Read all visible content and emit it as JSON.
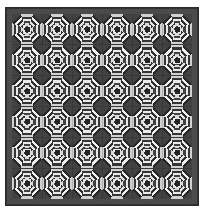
{
  "artwork": {
    "title": "Pineapple Log Cabin Quilt",
    "type": "textile-pattern-photograph",
    "medium": "grayscale halftone photograph of a pieced quilt",
    "description": "A six-by-six grid of pineapple log cabin quilt blocks enclosed by a dark border. Each block is built from concentric notched square rings that alternate between dark and light fabric, with dark fabric at the block corners and light fabric at the edge midpoints, so that adjacent blocks merge into dark diagonal crosses and light eight-pointed star motifs."
  },
  "canvas": {
    "width": 208,
    "height": 218,
    "background": "#ffffff"
  },
  "quilt": {
    "left": 6,
    "top": 8,
    "width": 192,
    "height": 197,
    "border_outer_color": "#2b2b2b",
    "border_outer_width": 2,
    "border_inner_color": "#454545",
    "border_inner_width": 4,
    "border_total_width": 6,
    "field_background": "#3c3c3c"
  },
  "grid": {
    "columns": 6,
    "rows": 6,
    "total_blocks": 36,
    "block_width": 30,
    "block_height": 30.8,
    "gap": 0
  },
  "palette": {
    "darkest": "#1c1c1c",
    "dark": "#333333",
    "mid_dark": "#4f4f4f",
    "mid": "#6e6e6e",
    "mid_light": "#9a9a9a",
    "light": "#c8c8c8",
    "lightest": "#f2f2f2",
    "white": "#ffffff",
    "border": "#2b2b2b",
    "paper": "#ffffff"
  },
  "block": {
    "name": "pineapple-block",
    "ring_count": 7,
    "center_color": "#1c1c1c",
    "center_size": 5,
    "notch_ratio": 0.42,
    "rings": [
      {
        "index": 0,
        "corner_color": "#2a2a2a",
        "edge_color": "#e8e8e8",
        "thickness": 2.1
      },
      {
        "index": 1,
        "corner_color": "#f0f0f0",
        "edge_color": "#333333",
        "thickness": 2.1
      },
      {
        "index": 2,
        "corner_color": "#2a2a2a",
        "edge_color": "#dcdcdc",
        "thickness": 2.1
      },
      {
        "index": 3,
        "corner_color": "#e6e6e6",
        "edge_color": "#3a3a3a",
        "thickness": 2.1
      },
      {
        "index": 4,
        "corner_color": "#262626",
        "edge_color": "#ededed",
        "thickness": 2.1
      },
      {
        "index": 5,
        "corner_color": "#f2f2f2",
        "edge_color": "#2e2e2e",
        "thickness": 2.1
      },
      {
        "index": 6,
        "corner_color": "#202020",
        "edge_color": "#d2d2d2",
        "thickness": 2.1
      }
    ]
  },
  "texture": {
    "scan_noise": true,
    "noise_opacity": 0.1,
    "halftone": true
  }
}
